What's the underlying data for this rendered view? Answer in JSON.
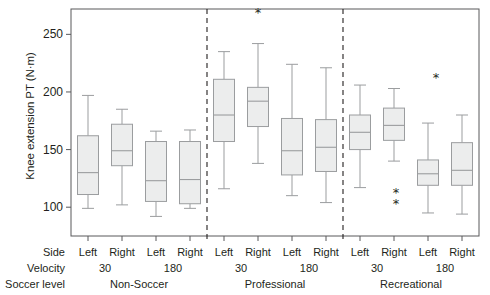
{
  "chart_data": {
    "type": "box",
    "title": "",
    "ylabel": "Knee extension PT (N·m)",
    "xlabel": "",
    "ylim": [
      75,
      272
    ],
    "yticks": [
      100,
      150,
      200,
      250
    ],
    "ytick_labels": [
      "100",
      "150",
      "200",
      "250"
    ],
    "grid": false,
    "legend": false,
    "box_fill": "#eceded",
    "box_stroke": "#9b9d9f",
    "axis_color": "#58595b",
    "marker_color": "#231f20",
    "row_headers": [
      "Side",
      "Velocity",
      "Soccer level"
    ],
    "groups": [
      {
        "soccer_level": "Non-Soccer",
        "velocities": [
          {
            "velocity": "30",
            "boxes": [
              {
                "side": "Left",
                "min": 99,
                "q1": 111,
                "median": 130,
                "q3": 162,
                "max": 197
              },
              {
                "side": "Right",
                "min": 102,
                "q1": 136,
                "median": 149,
                "q3": 172,
                "max": 185
              }
            ]
          },
          {
            "velocity": "180",
            "boxes": [
              {
                "side": "Left",
                "min": 92,
                "q1": 105,
                "median": 123,
                "q3": 157,
                "max": 166
              },
              {
                "side": "Right",
                "min": 99,
                "q1": 103,
                "median": 124,
                "q3": 157,
                "max": 167
              }
            ]
          }
        ]
      },
      {
        "soccer_level": "Professional",
        "velocities": [
          {
            "velocity": "30",
            "boxes": [
              {
                "side": "Left",
                "min": 116,
                "q1": 157,
                "median": 180,
                "q3": 211,
                "max": 235
              },
              {
                "side": "Right",
                "min": 138,
                "q1": 170,
                "median": 192,
                "q3": 204,
                "max": 242
              }
            ]
          },
          {
            "velocity": "180",
            "boxes": [
              {
                "side": "Left",
                "min": 110,
                "q1": 128,
                "median": 149,
                "q3": 177,
                "max": 224
              },
              {
                "side": "Right",
                "min": 104,
                "q1": 131,
                "median": 152,
                "q3": 176,
                "max": 221
              }
            ]
          }
        ]
      },
      {
        "soccer_level": "Recreational",
        "velocities": [
          {
            "velocity": "30",
            "boxes": [
              {
                "side": "Left",
                "min": 117,
                "q1": 150,
                "median": 165,
                "q3": 180,
                "max": 206
              },
              {
                "side": "Right",
                "min": 140,
                "q1": 158,
                "median": 171,
                "q3": 186,
                "max": 203
              }
            ]
          },
          {
            "velocity": "180",
            "boxes": [
              {
                "side": "Left",
                "min": 95,
                "q1": 119,
                "median": 129,
                "q3": 141,
                "max": 173
              },
              {
                "side": "Right",
                "min": 94,
                "q1": 119,
                "median": 132,
                "q3": 156,
                "max": 180
              }
            ]
          }
        ]
      }
    ],
    "significance_markers": [
      {
        "label": "*",
        "x_value": 258,
        "y_value": 13,
        "note": "above Professional 30 Right box"
      },
      {
        "label": "*",
        "x_value": 436,
        "y_value": 78,
        "note": "above Recreational 180 area"
      },
      {
        "label": "*",
        "x_value": 396,
        "y_value": 193,
        "note": "below Recreational 30 Right box"
      },
      {
        "label": "*",
        "x_value": 396,
        "y_value": 204,
        "note": "below Recreational 30 Right box"
      }
    ],
    "group_dividers": [
      2,
      4
    ]
  },
  "axis": {
    "ylabel_text": "Knee extension PT (N·m)",
    "ticks": [
      {
        "label": "250"
      },
      {
        "label": "200"
      },
      {
        "label": "150"
      },
      {
        "label": "100"
      }
    ]
  },
  "table": {
    "rows": [
      {
        "header": "Side",
        "cells": [
          "Left",
          "Right",
          "Left",
          "Right",
          "Left",
          "Right",
          "Left",
          "Right",
          "Left",
          "Right",
          "Left",
          "Right"
        ]
      },
      {
        "header": "Velocity",
        "cells": [
          "30",
          "180",
          "30",
          "180",
          "30",
          "180"
        ]
      },
      {
        "header": "Soccer level",
        "cells": [
          "Non-Soccer",
          "Professional",
          "Recreational"
        ]
      }
    ]
  }
}
